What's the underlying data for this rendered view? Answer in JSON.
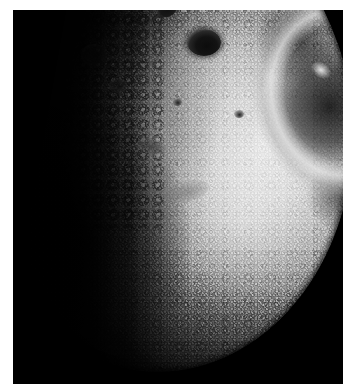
{
  "image": {
    "kind": "photograph",
    "subject": "heavily cratered airless planetary body",
    "capture": "spacecraft grayscale image",
    "alt_text": "Black-and-white spacecraft photograph of a heavily cratered moon, its sunlit cratered surface on the right fading into a dark terminator shadow on the left, with the curved limb against black space at lower right.",
    "border_color": "#ffffff",
    "space_color": "#000000",
    "frame": {
      "left": 13,
      "top": 10,
      "width": 330,
      "height": 374
    },
    "features": [
      {
        "name": "terminator",
        "label": "terminator shadow boundary",
        "position": "vertical band, left-of-center"
      },
      {
        "name": "bright-limb-arc",
        "label": "sunlit limb arc",
        "position": "upper right"
      },
      {
        "name": "dark-patch",
        "label": "shadowed limb region",
        "position": "mid right"
      },
      {
        "name": "crater-main",
        "label": "prominent dark floored crater",
        "position": "center right"
      },
      {
        "name": "crater-secondary",
        "label": "secondary dark crater",
        "position": "above and left of main crater"
      },
      {
        "name": "limb-edge",
        "label": "curved limb against space",
        "position": "lower right"
      },
      {
        "name": "crater-field",
        "label": "densely cratered highland terrain",
        "position": "upper center"
      }
    ],
    "tones": {
      "highlight": "#e9e9e9",
      "midtone": "#969696",
      "shadow": "#2a2a2a",
      "black": "#000000"
    }
  }
}
